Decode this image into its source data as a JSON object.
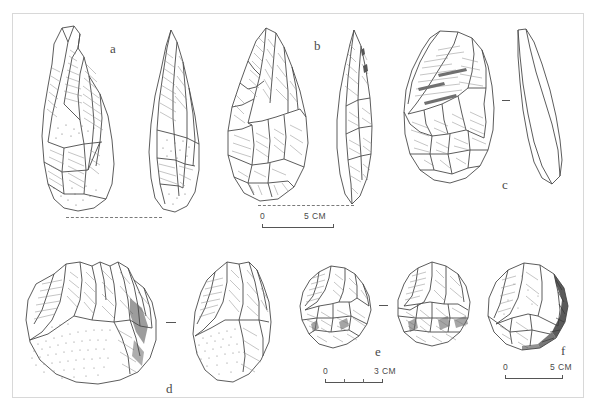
{
  "plate": {
    "title": "Lithic artifact plate",
    "background_color": "#ffffff",
    "frame_color": "#d8d8d8",
    "ink_color": "#3a3a3a"
  },
  "artifacts": [
    {
      "id": "a",
      "label": "a",
      "description": "Pointed biface / elongated handaxe, ventral face and lateral profile views",
      "views": 2,
      "has_cortex_stipple": true,
      "scale_ref": "scale_5cm_top"
    },
    {
      "id": "b",
      "label": "b",
      "description": "Ovate-cordiform handaxe, face view and lateral profile view",
      "views": 2,
      "has_cortex_stipple": false,
      "scale_ref": "scale_5cm_top"
    },
    {
      "id": "c",
      "label": "c",
      "description": "Levallois flake, dorsal view and lateral profile view",
      "views": 2,
      "has_cortex_stipple": false,
      "scale_ref": "scale_5cm_top"
    },
    {
      "id": "d",
      "label": "d",
      "description": "Chopper / core on cobble with cortical surface, two views",
      "views": 2,
      "has_cortex_stipple": true,
      "scale_ref": "scale_3cm_bottom"
    },
    {
      "id": "e",
      "label": "e",
      "description": "Discoidal core, two opposed face views",
      "views": 2,
      "has_cortex_stipple": false,
      "scale_ref": "scale_3cm_bottom"
    },
    {
      "id": "f",
      "label": "f",
      "description": "Spheroid / polyhedral core with dark cortical margin",
      "views": 1,
      "has_cortex_stipple": false,
      "scale_ref": "scale_5cm_bottom"
    }
  ],
  "scales": [
    {
      "id": "scale_5cm_top",
      "zero_label": "0",
      "max_label": "5 CM",
      "max_value": 5,
      "unit": "CM",
      "ticks": 0,
      "applies_to": [
        "a",
        "b",
        "c"
      ]
    },
    {
      "id": "scale_3cm_bottom",
      "zero_label": "0",
      "max_label": "3 CM",
      "max_value": 3,
      "unit": "CM",
      "ticks": 3,
      "applies_to": [
        "d",
        "e"
      ]
    },
    {
      "id": "scale_5cm_bottom",
      "zero_label": "0",
      "max_label": "5 CM",
      "max_value": 5,
      "unit": "CM",
      "ticks": 0,
      "applies_to": [
        "f"
      ]
    }
  ],
  "guides": [
    {
      "id": "baseline-dash-a",
      "type": "dashed-baseline",
      "description": "dashed line joining bases of artifact a views"
    },
    {
      "id": "baseline-dash-b",
      "type": "dashed-baseline",
      "description": "dashed line joining bases of artifact b views"
    }
  ]
}
